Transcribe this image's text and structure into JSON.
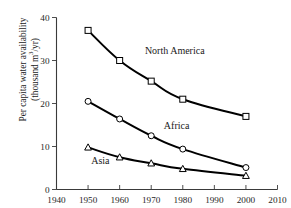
{
  "chart_data": {
    "type": "line",
    "title": "",
    "subtitle": "",
    "xlabel": "",
    "ylabel": "Per capita water availability (thousand m3/yr)",
    "ylabel_line1": "Per capita water availability",
    "ylabel_line2_prefix": "(thousand m",
    "ylabel_line2_sup": "3",
    "ylabel_line2_suffix": "/yr)",
    "x": [
      1950,
      1960,
      1970,
      1980,
      2000
    ],
    "xlim": [
      1940,
      2010
    ],
    "ylim": [
      0,
      40
    ],
    "xticks": [
      1940,
      1950,
      1960,
      1970,
      1980,
      1990,
      2000,
      2010
    ],
    "xtick_labels": [
      "1940",
      "1950",
      "1960",
      "1970",
      "1980",
      "1990",
      "2000",
      "2010"
    ],
    "yticks": [
      0,
      10,
      20,
      30,
      40
    ],
    "ytick_labels": [
      "0",
      "10",
      "20",
      "30",
      "40"
    ],
    "grid": false,
    "legend_position": "inline-annotations",
    "series": [
      {
        "name": "North America",
        "marker": "square",
        "values": [
          37.0,
          30.0,
          25.2,
          21.0,
          17.0
        ]
      },
      {
        "name": "Africa",
        "marker": "circle",
        "values": [
          20.5,
          16.4,
          12.5,
          9.4,
          5.1
        ]
      },
      {
        "name": "Asia",
        "marker": "triangle",
        "values": [
          9.8,
          7.5,
          6.1,
          4.8,
          3.2
        ]
      }
    ],
    "annotations": [
      {
        "text": "North America",
        "x": 1968,
        "y": 31.5
      },
      {
        "text": "Africa",
        "x": 1974,
        "y": 14.0
      },
      {
        "text": "Asia",
        "x": 1951,
        "y": 6.0
      }
    ],
    "colors": {
      "line": "#000000",
      "marker_fill": "#ffffff",
      "marker_stroke": "#000000",
      "axis": "#3a3a3a",
      "text": "#1a1a1a",
      "background": "#ffffff"
    }
  }
}
